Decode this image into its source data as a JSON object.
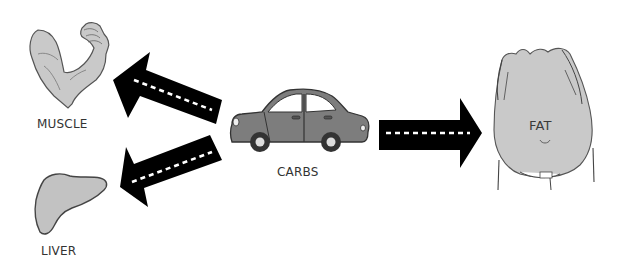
{
  "diagram": {
    "type": "flow",
    "source": {
      "label": "CARBS",
      "icon": "car-icon"
    },
    "targets": [
      {
        "label": "MUSCLE",
        "icon": "flexed-arm-icon",
        "direction": "left-up"
      },
      {
        "label": "LIVER",
        "icon": "liver-icon",
        "direction": "left-down"
      },
      {
        "label": "FAT",
        "icon": "belly-icon",
        "direction": "right"
      }
    ],
    "colors": {
      "arrow": "#000000",
      "dash": "#ffffff",
      "fill_gray": "#c9c9c9",
      "car_gray": "#7d7d7d",
      "outline": "#444444"
    }
  },
  "labels": {
    "muscle": "MUSCLE",
    "liver": "LIVER",
    "carbs": "CARBS",
    "fat": "FAT"
  }
}
